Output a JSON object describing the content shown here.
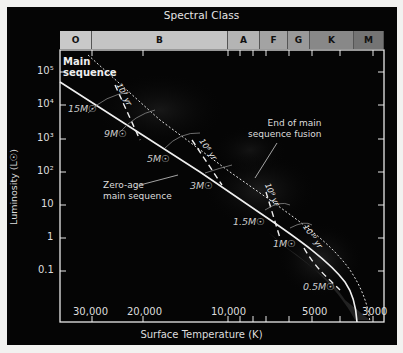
{
  "title": "Spectral Class",
  "spectral_classes": [
    {
      "label": "O",
      "width": 32,
      "color": "#c9c9c9"
    },
    {
      "label": "B",
      "width": 136,
      "color": "#c4c4c4"
    },
    {
      "label": "A",
      "width": 32,
      "color": "#b4b4b4"
    },
    {
      "label": "F",
      "width": 28,
      "color": "#a3a3a3"
    },
    {
      "label": "G",
      "width": 22,
      "color": "#999999"
    },
    {
      "label": "K",
      "width": 44,
      "color": "#888888"
    },
    {
      "label": "M",
      "width": 30,
      "color": "#747474"
    }
  ],
  "axes": {
    "ylabel": "Luminosity (L☉)",
    "xlabel": "Surface Temperature (K)",
    "y_ticks": [
      "10⁵",
      "10⁴",
      "10³",
      "10²",
      "10",
      "1",
      "0.1"
    ],
    "x_ticks": [
      "30,000",
      "20,000",
      "10,000",
      "5000",
      "3000"
    ]
  },
  "annotations": {
    "main_sequence_line1": "Main",
    "main_sequence_line2": "sequence",
    "zams_line1": "Zero-age",
    "zams_line2": "main sequence",
    "end_line1": "End of main",
    "end_line2": "sequence fusion"
  },
  "masses": [
    "15M☉",
    "9M☉",
    "5M☉",
    "3M☉",
    "1.5M☉",
    "1M☉",
    "0.5M☉"
  ],
  "isochrones": [
    "10⁷ yr",
    "10⁸ yr",
    "10⁹ yr",
    "10¹⁰ yr"
  ],
  "chart_data": {
    "type": "line",
    "title": "Spectral Class",
    "xlabel": "Surface Temperature (K)",
    "ylabel": "Luminosity (L☉)",
    "x_scale": "log (reversed)",
    "y_scale": "log",
    "x_ticks": [
      30000,
      20000,
      10000,
      5000,
      3000
    ],
    "y_ticks": [
      100000,
      10000,
      1000,
      100,
      10,
      1,
      0.1
    ],
    "spectral_classes": [
      "O",
      "B",
      "A",
      "F",
      "G",
      "K",
      "M"
    ],
    "series": [
      {
        "name": "Zero-age main sequence",
        "style": "solid",
        "points": [
          [
            40000,
            50000
          ],
          [
            30000,
            15000
          ],
          [
            20000,
            1500
          ],
          [
            10000,
            40
          ],
          [
            7000,
            6
          ],
          [
            5800,
            1
          ],
          [
            4500,
            0.2
          ],
          [
            3800,
            0.02
          ]
        ]
      },
      {
        "name": "End of main sequence fusion",
        "style": "dotted",
        "points": [
          [
            33000,
            200000
          ],
          [
            20000,
            20000
          ],
          [
            10000,
            800
          ],
          [
            7000,
            50
          ],
          [
            5500,
            5
          ],
          [
            4200,
            0.5
          ],
          [
            3300,
            0.02
          ]
        ]
      }
    ],
    "mass_labels": [
      "15M☉",
      "9M☉",
      "5M☉",
      "3M☉",
      "1.5M☉",
      "1M☉",
      "0.5M☉"
    ],
    "isochrones": [
      "10^7 yr",
      "10^8 yr",
      "10^9 yr",
      "10^10 yr"
    ],
    "grid": false
  }
}
